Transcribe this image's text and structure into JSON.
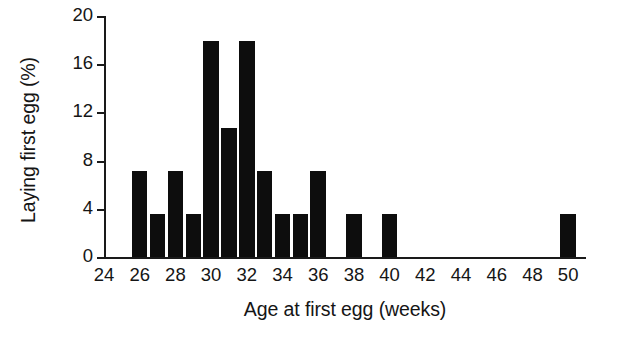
{
  "chart_data": {
    "type": "bar",
    "title": "",
    "xlabel": "Age at first egg (weeks)",
    "ylabel": "Laying first egg (%)",
    "xlim": [
      24,
      51
    ],
    "ylim": [
      0,
      20
    ],
    "grid": false,
    "legend": null,
    "bar_color": "#0d0d0d",
    "axis_color": "#1a1a1a",
    "bin_width": 1,
    "xticks": [
      24,
      26,
      28,
      30,
      32,
      34,
      36,
      38,
      40,
      42,
      44,
      46,
      48,
      50
    ],
    "yticks": [
      0,
      4,
      8,
      12,
      16,
      20
    ],
    "categories": [
      26,
      27,
      28,
      29,
      30,
      31,
      32,
      33,
      34,
      35,
      36,
      38,
      40,
      50
    ],
    "values": [
      7.1,
      3.6,
      7.1,
      3.6,
      17.9,
      10.7,
      17.9,
      7.1,
      3.6,
      3.6,
      7.1,
      3.6,
      3.6,
      3.6
    ]
  }
}
